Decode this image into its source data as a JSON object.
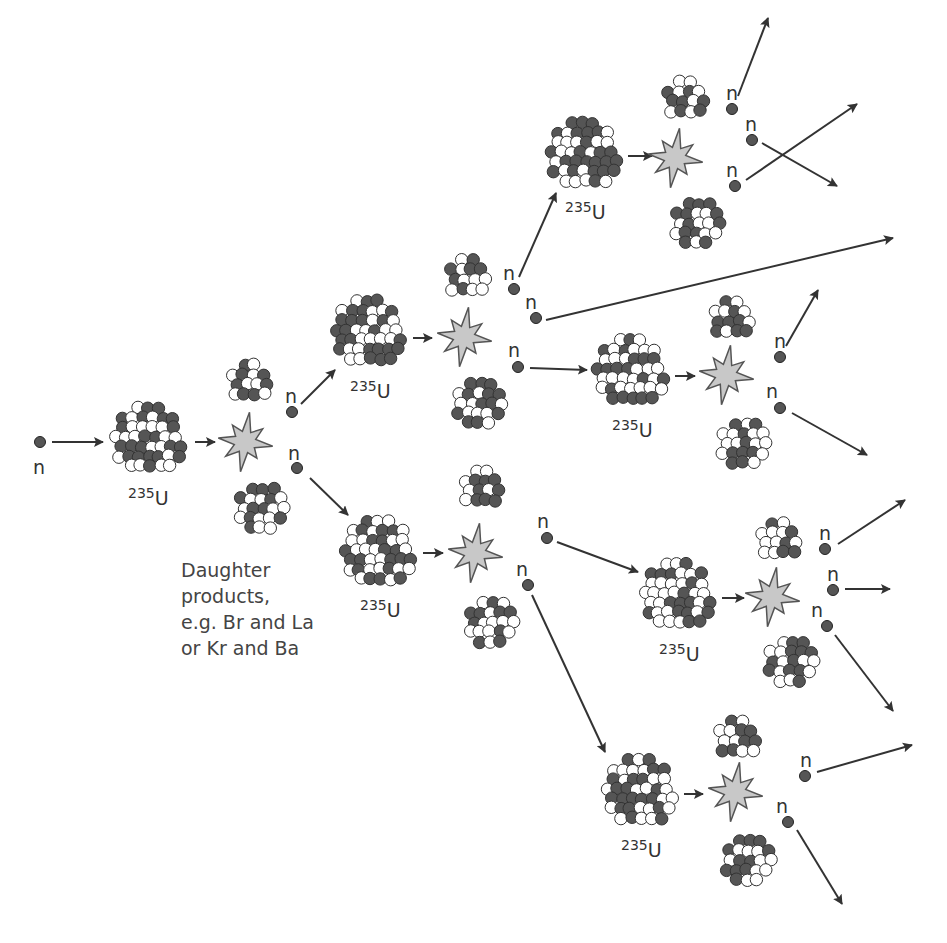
{
  "diagram": {
    "neutron_label": "n",
    "isotope": {
      "mass_number": "235",
      "symbol": "U"
    },
    "caption": {
      "lines": [
        "Daughter",
        "products,",
        "e.g. Br and La",
        "or Kr and Ba"
      ]
    },
    "colors": {
      "background": "#ffffff",
      "dark_nucleon": "#555555",
      "light_nucleon": "#ffffff",
      "nucleon_outline": "#333333",
      "flash_fill": "#c8c8c8",
      "flash_outline": "#555555",
      "arrow": "#333333",
      "neutron": "#555555",
      "text": "#333333"
    },
    "generations": [
      {
        "level": 1,
        "uranium_nuclei": 1,
        "neutrons_released": 2
      },
      {
        "level": 2,
        "uranium_nuclei": 2,
        "neutrons_released": 5
      },
      {
        "level": 3,
        "uranium_nuclei": 4,
        "neutrons_released": 9
      }
    ],
    "uranium_nuclei": [
      {
        "id": "u1",
        "cx": 150,
        "cy": 440,
        "r": 38,
        "label_x": 128,
        "label_y": 505
      },
      {
        "id": "u2a",
        "cx": 370,
        "cy": 333,
        "r": 38,
        "label_x": 350,
        "label_y": 398
      },
      {
        "id": "u2b",
        "cx": 380,
        "cy": 553,
        "r": 38,
        "label_x": 360,
        "label_y": 617
      },
      {
        "id": "u3a",
        "cx": 585,
        "cy": 155,
        "r": 38,
        "label_x": 565,
        "label_y": 219
      },
      {
        "id": "u3b",
        "cx": 632,
        "cy": 372,
        "r": 38,
        "label_x": 612,
        "label_y": 437
      },
      {
        "id": "u3c",
        "cx": 679,
        "cy": 596,
        "r": 38,
        "label_x": 659,
        "label_y": 661
      },
      {
        "id": "u3d",
        "cx": 641,
        "cy": 792,
        "r": 38,
        "label_x": 621,
        "label_y": 857
      }
    ],
    "flashes": [
      {
        "id": "f1",
        "cx": 245,
        "cy": 442
      },
      {
        "id": "f2a",
        "cx": 464,
        "cy": 337
      },
      {
        "id": "f2b",
        "cx": 475,
        "cy": 553
      },
      {
        "id": "f3a",
        "cx": 675,
        "cy": 158
      },
      {
        "id": "f3b",
        "cx": 726,
        "cy": 375
      },
      {
        "id": "f3c",
        "cx": 772,
        "cy": 597
      },
      {
        "id": "f3d",
        "cx": 735,
        "cy": 792
      }
    ],
    "daughters": [
      {
        "cx": 252,
        "cy": 383,
        "r": 24
      },
      {
        "cx": 262,
        "cy": 510,
        "r": 27
      },
      {
        "cx": 470,
        "cy": 278,
        "r": 24
      },
      {
        "cx": 480,
        "cy": 405,
        "r": 27
      },
      {
        "cx": 484,
        "cy": 489,
        "r": 24
      },
      {
        "cx": 492,
        "cy": 624,
        "r": 27
      },
      {
        "cx": 687,
        "cy": 99,
        "r": 23
      },
      {
        "cx": 698,
        "cy": 225,
        "r": 27
      },
      {
        "cx": 733,
        "cy": 319,
        "r": 23
      },
      {
        "cx": 745,
        "cy": 445,
        "r": 27
      },
      {
        "cx": 780,
        "cy": 540,
        "r": 23
      },
      {
        "cx": 792,
        "cy": 663,
        "r": 27
      },
      {
        "cx": 739,
        "cy": 738,
        "r": 23
      },
      {
        "cx": 749,
        "cy": 862,
        "r": 27
      }
    ],
    "neutrons": [
      {
        "cx": 40,
        "cy": 442,
        "lx": 33,
        "ly": 474
      },
      {
        "cx": 292,
        "cy": 412,
        "lx": 285,
        "ly": 403
      },
      {
        "cx": 297,
        "cy": 468,
        "lx": 288,
        "ly": 460
      },
      {
        "cx": 514,
        "cy": 289,
        "lx": 503,
        "ly": 280
      },
      {
        "cx": 536,
        "cy": 318,
        "lx": 525,
        "ly": 309
      },
      {
        "cx": 518,
        "cy": 367,
        "lx": 508,
        "ly": 357
      },
      {
        "cx": 547,
        "cy": 538,
        "lx": 537,
        "ly": 528
      },
      {
        "cx": 528,
        "cy": 585,
        "lx": 516,
        "ly": 576
      },
      {
        "cx": 732,
        "cy": 109,
        "lx": 726,
        "ly": 100
      },
      {
        "cx": 752,
        "cy": 140,
        "lx": 745,
        "ly": 131
      },
      {
        "cx": 735,
        "cy": 186,
        "lx": 726,
        "ly": 177
      },
      {
        "cx": 780,
        "cy": 357,
        "lx": 774,
        "ly": 348
      },
      {
        "cx": 780,
        "cy": 408,
        "lx": 766,
        "ly": 398
      },
      {
        "cx": 825,
        "cy": 549,
        "lx": 819,
        "ly": 540
      },
      {
        "cx": 833,
        "cy": 590,
        "lx": 827,
        "ly": 581
      },
      {
        "cx": 827,
        "cy": 626,
        "lx": 811,
        "ly": 617
      },
      {
        "cx": 805,
        "cy": 776,
        "lx": 800,
        "ly": 767
      },
      {
        "cx": 788,
        "cy": 822,
        "lx": 776,
        "ly": 813
      }
    ],
    "arrows": [
      {
        "x1": 52,
        "y1": 442,
        "x2": 103,
        "y2": 442
      },
      {
        "x1": 195,
        "y1": 442,
        "x2": 215,
        "y2": 442
      },
      {
        "x1": 301,
        "y1": 404,
        "x2": 335,
        "y2": 370
      },
      {
        "x1": 310,
        "y1": 478,
        "x2": 348,
        "y2": 515
      },
      {
        "x1": 413,
        "y1": 338,
        "x2": 432,
        "y2": 338
      },
      {
        "x1": 423,
        "y1": 553,
        "x2": 443,
        "y2": 553
      },
      {
        "x1": 519,
        "y1": 277,
        "x2": 556,
        "y2": 193
      },
      {
        "x1": 546,
        "y1": 320,
        "x2": 893,
        "y2": 238
      },
      {
        "x1": 530,
        "y1": 368,
        "x2": 587,
        "y2": 370
      },
      {
        "x1": 557,
        "y1": 542,
        "x2": 638,
        "y2": 572
      },
      {
        "x1": 532,
        "y1": 595,
        "x2": 605,
        "y2": 752
      },
      {
        "x1": 628,
        "y1": 156,
        "x2": 652,
        "y2": 156
      },
      {
        "x1": 675,
        "y1": 376,
        "x2": 695,
        "y2": 376
      },
      {
        "x1": 722,
        "y1": 598,
        "x2": 744,
        "y2": 598
      },
      {
        "x1": 684,
        "y1": 794,
        "x2": 703,
        "y2": 794
      },
      {
        "x1": 738,
        "y1": 96,
        "x2": 768,
        "y2": 18
      },
      {
        "x1": 762,
        "y1": 143,
        "x2": 837,
        "y2": 186
      },
      {
        "x1": 746,
        "y1": 180,
        "x2": 857,
        "y2": 104
      },
      {
        "x1": 786,
        "y1": 346,
        "x2": 818,
        "y2": 290
      },
      {
        "x1": 792,
        "y1": 413,
        "x2": 867,
        "y2": 455
      },
      {
        "x1": 838,
        "y1": 544,
        "x2": 905,
        "y2": 500
      },
      {
        "x1": 845,
        "y1": 589,
        "x2": 890,
        "y2": 589
      },
      {
        "x1": 835,
        "y1": 635,
        "x2": 893,
        "y2": 711
      },
      {
        "x1": 817,
        "y1": 772,
        "x2": 912,
        "y2": 745
      },
      {
        "x1": 797,
        "y1": 830,
        "x2": 842,
        "y2": 904
      }
    ]
  }
}
